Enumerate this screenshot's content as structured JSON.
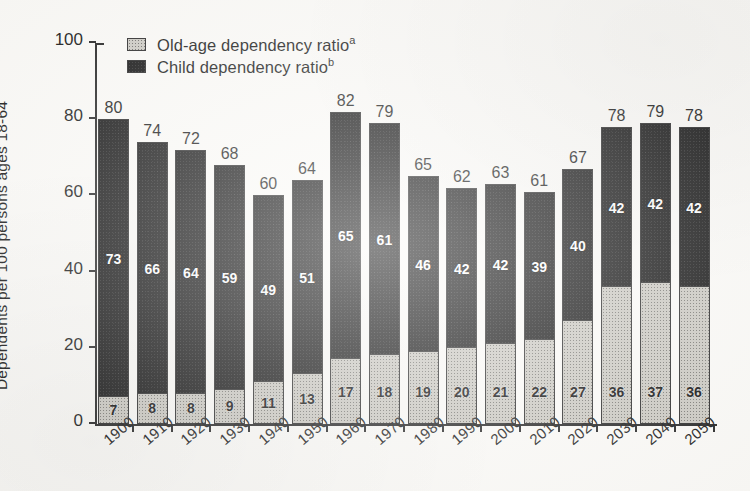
{
  "chart_data": {
    "type": "bar",
    "subtype": "stacked-vertical",
    "title": "",
    "xlabel": "",
    "ylabel": "Dependents per 100 persons ages 18-64",
    "ylim": [
      0,
      100
    ],
    "yticks": [
      0,
      20,
      40,
      60,
      80,
      100
    ],
    "grid": false,
    "legend_position": "top-left-inside",
    "categories": [
      "1900",
      "1910",
      "1920",
      "1930",
      "1940",
      "1950",
      "1960",
      "1970",
      "1980",
      "1990",
      "2000",
      "2010",
      "2020",
      "2030",
      "2040",
      "2050"
    ],
    "series": [
      {
        "name": "Old-age dependency ratio",
        "footnote": "a",
        "color": "#cbc9c2",
        "pattern": "stippled-gray",
        "values": [
          7,
          8,
          8,
          9,
          11,
          13,
          17,
          18,
          19,
          20,
          21,
          22,
          27,
          36,
          37,
          36
        ]
      },
      {
        "name": "Child dependency ratio",
        "footnote": "b",
        "color": "#141414",
        "pattern": "solid-black",
        "values": [
          73,
          66,
          64,
          59,
          49,
          51,
          65,
          61,
          46,
          42,
          42,
          39,
          40,
          42,
          42,
          42
        ]
      }
    ],
    "totals": [
      80,
      74,
      72,
      68,
      60,
      64,
      82,
      79,
      65,
      62,
      63,
      61,
      67,
      78,
      79,
      78
    ],
    "annotations": {
      "total_labels_above_bars": true,
      "segment_labels_inside_bars": true
    }
  },
  "legend": {
    "items": [
      {
        "label": "Old-age dependency ratio",
        "footnote": "a",
        "swatch": "gray-stipple-swatch"
      },
      {
        "label": "Child dependency ratio",
        "footnote": "b",
        "swatch": "black-swatch"
      }
    ]
  },
  "axes": {
    "y": {
      "title": "Dependents per 100 persons ages 18-64",
      "tick_labels": [
        "0",
        "20",
        "40",
        "60",
        "80",
        "100"
      ]
    },
    "x": {
      "tick_labels": [
        "1900",
        "1910",
        "1920",
        "1930",
        "1940",
        "1950",
        "1960",
        "1970",
        "1980",
        "1990",
        "2000",
        "2010",
        "2020",
        "2030",
        "2040",
        "2050"
      ]
    }
  },
  "colors": {
    "background": "#fbfaf7",
    "ink": "#1a1a1a",
    "child_segment": "#141414",
    "old_age_segment": "#cbc9c2"
  }
}
